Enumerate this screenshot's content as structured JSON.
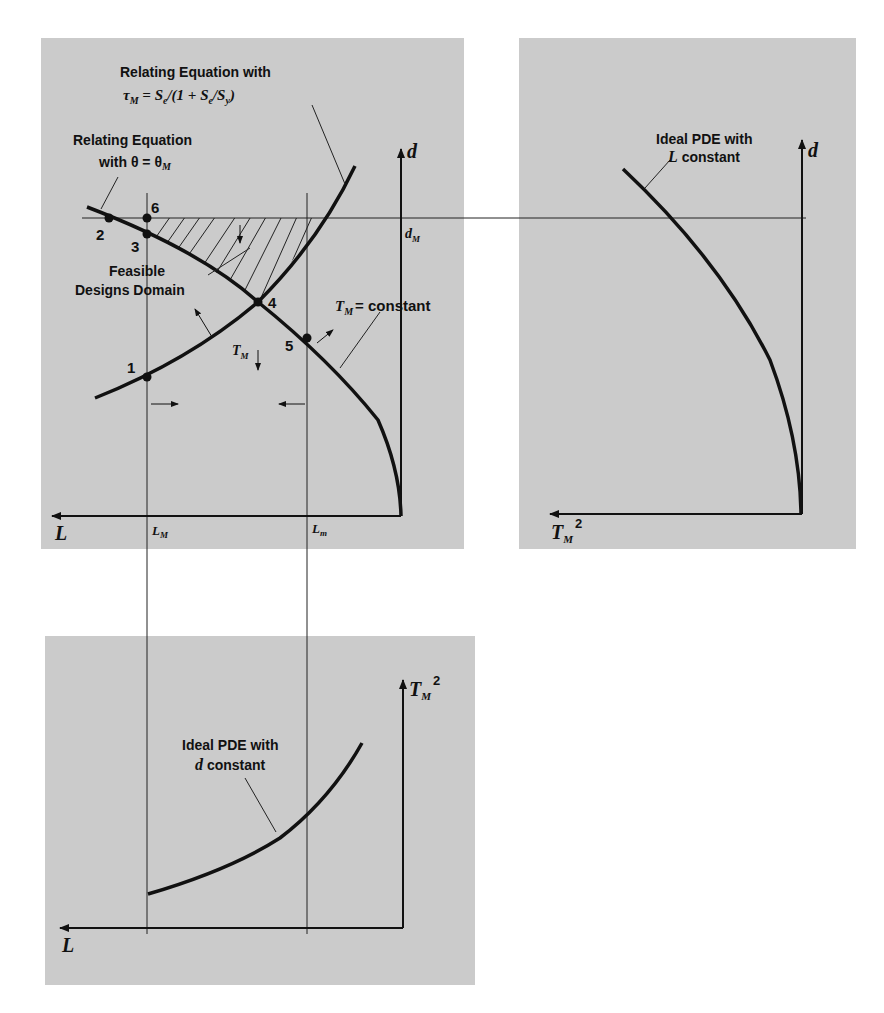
{
  "figure": {
    "panels": [
      {
        "id": "design-space",
        "axes": {
          "x": "L",
          "y": "d"
        }
      },
      {
        "id": "d-vs-tm2",
        "axes": {
          "x": "T_M^2",
          "y": "d"
        }
      },
      {
        "id": "tm2-vs-l",
        "axes": {
          "x": "L",
          "y": "T_M^2"
        }
      }
    ]
  },
  "panel_main": {
    "label_tau_line1": "Relating Equation with",
    "label_tau_line2_parts": [
      "τ",
      "M",
      " = S",
      "e",
      "/(1 + S",
      "e",
      "/S",
      "y",
      ")"
    ],
    "label_theta_line1": "Relating Equation",
    "label_theta_line2": "with θ = θ",
    "label_theta_sub": "M",
    "feasible_line1": "Feasible",
    "feasible_line2": "Designs Domain",
    "tm_const": "= constant",
    "tm_T": "T",
    "tm_sub": "M",
    "tm_arrow_T": "T",
    "tm_arrow_sub": "M",
    "axis_d": "d",
    "axis_L": "L",
    "dM": "d",
    "dM_sub": "M",
    "LM": "L",
    "LM_sub": "M",
    "Lm": "L",
    "Lm_sub": "m",
    "points": [
      "1",
      "2",
      "3",
      "4",
      "5",
      "6"
    ]
  },
  "panel_right": {
    "label_line1": "Ideal PDE with",
    "label_line2_var": "L",
    "label_line2_rest": " constant",
    "axis_d": "d",
    "axis_x_T": "T",
    "axis_x_sub": "M",
    "axis_x_sup": "2"
  },
  "panel_bottom": {
    "label_line1": "Ideal PDE with",
    "label_line2_var": "d",
    "label_line2_rest": " constant",
    "axis_y_T": "T",
    "axis_y_sub": "M",
    "axis_y_sup": "2",
    "axis_L": "L"
  }
}
